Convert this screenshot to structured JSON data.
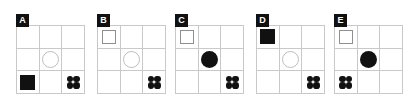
{
  "figure": {
    "type": "shape-grid-panels",
    "panel_count": 5,
    "grid_rows": 3,
    "grid_cols": 3,
    "background_color": "#ffffff",
    "grid_line_color": "#c9c9c9",
    "shape_fill_color": "#111111",
    "shape_outline_color": "#8f8f8f",
    "badge_background_color": "#111111",
    "badge_text_color": "#ffffff"
  },
  "panels": [
    {
      "label": "A",
      "left": 16,
      "cells": [
        {
          "row": 0,
          "col": 0,
          "shape": "empty"
        },
        {
          "row": 0,
          "col": 1,
          "shape": "empty"
        },
        {
          "row": 0,
          "col": 2,
          "shape": "empty"
        },
        {
          "row": 1,
          "col": 0,
          "shape": "empty"
        },
        {
          "row": 1,
          "col": 1,
          "shape": "circle-outline"
        },
        {
          "row": 1,
          "col": 2,
          "shape": "empty"
        },
        {
          "row": 2,
          "col": 0,
          "shape": "square-filled"
        },
        {
          "row": 2,
          "col": 1,
          "shape": "empty"
        },
        {
          "row": 2,
          "col": 2,
          "shape": "dots-four"
        }
      ]
    },
    {
      "label": "B",
      "left": 97,
      "cells": [
        {
          "row": 0,
          "col": 0,
          "shape": "square-outline"
        },
        {
          "row": 0,
          "col": 1,
          "shape": "empty"
        },
        {
          "row": 0,
          "col": 2,
          "shape": "empty"
        },
        {
          "row": 1,
          "col": 0,
          "shape": "empty"
        },
        {
          "row": 1,
          "col": 1,
          "shape": "circle-outline"
        },
        {
          "row": 1,
          "col": 2,
          "shape": "empty"
        },
        {
          "row": 2,
          "col": 0,
          "shape": "empty"
        },
        {
          "row": 2,
          "col": 1,
          "shape": "empty"
        },
        {
          "row": 2,
          "col": 2,
          "shape": "dots-four"
        }
      ]
    },
    {
      "label": "C",
      "left": 175,
      "cells": [
        {
          "row": 0,
          "col": 0,
          "shape": "square-outline"
        },
        {
          "row": 0,
          "col": 1,
          "shape": "empty"
        },
        {
          "row": 0,
          "col": 2,
          "shape": "empty"
        },
        {
          "row": 1,
          "col": 0,
          "shape": "empty"
        },
        {
          "row": 1,
          "col": 1,
          "shape": "circle-filled"
        },
        {
          "row": 1,
          "col": 2,
          "shape": "empty"
        },
        {
          "row": 2,
          "col": 0,
          "shape": "empty"
        },
        {
          "row": 2,
          "col": 1,
          "shape": "empty"
        },
        {
          "row": 2,
          "col": 2,
          "shape": "dots-four"
        }
      ]
    },
    {
      "label": "D",
      "left": 256,
      "cells": [
        {
          "row": 0,
          "col": 0,
          "shape": "square-filled"
        },
        {
          "row": 0,
          "col": 1,
          "shape": "empty"
        },
        {
          "row": 0,
          "col": 2,
          "shape": "empty"
        },
        {
          "row": 1,
          "col": 0,
          "shape": "empty"
        },
        {
          "row": 1,
          "col": 1,
          "shape": "circle-outline"
        },
        {
          "row": 1,
          "col": 2,
          "shape": "empty"
        },
        {
          "row": 2,
          "col": 0,
          "shape": "empty"
        },
        {
          "row": 2,
          "col": 1,
          "shape": "empty"
        },
        {
          "row": 2,
          "col": 2,
          "shape": "dots-four"
        }
      ]
    },
    {
      "label": "E",
      "left": 334,
      "cells": [
        {
          "row": 0,
          "col": 0,
          "shape": "square-outline"
        },
        {
          "row": 0,
          "col": 1,
          "shape": "empty"
        },
        {
          "row": 0,
          "col": 2,
          "shape": "empty"
        },
        {
          "row": 1,
          "col": 0,
          "shape": "empty"
        },
        {
          "row": 1,
          "col": 1,
          "shape": "circle-filled"
        },
        {
          "row": 1,
          "col": 2,
          "shape": "empty"
        },
        {
          "row": 2,
          "col": 0,
          "shape": "dots-four"
        },
        {
          "row": 2,
          "col": 1,
          "shape": "empty"
        },
        {
          "row": 2,
          "col": 2,
          "shape": "empty"
        }
      ]
    }
  ]
}
